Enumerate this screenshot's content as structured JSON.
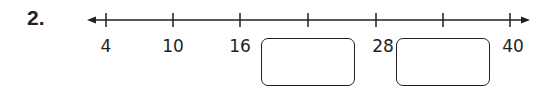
{
  "problem": {
    "number": "2."
  },
  "number_line": {
    "ticks": [
      {
        "x": 106,
        "value": 4,
        "label": "4",
        "blank": false
      },
      {
        "x": 173,
        "value": 10,
        "label": "10",
        "blank": false
      },
      {
        "x": 240,
        "value": 16,
        "label": "16",
        "blank": false
      },
      {
        "x": 308,
        "value": 22,
        "label": "",
        "blank": true
      },
      {
        "x": 376,
        "value": 28,
        "label": "28",
        "blank": false
      },
      {
        "x": 443,
        "value": 34,
        "label": "",
        "blank": true
      },
      {
        "x": 510,
        "value": 40,
        "label": "40",
        "blank": false
      }
    ],
    "labels": {
      "l0": "4",
      "l1": "10",
      "l2": "16",
      "l4": "28",
      "l6": "40"
    },
    "answer_boxes": [
      {
        "value": "",
        "position": "between 16 and 28"
      },
      {
        "value": "",
        "position": "between 28 and 40"
      }
    ],
    "color": "#231f20"
  }
}
